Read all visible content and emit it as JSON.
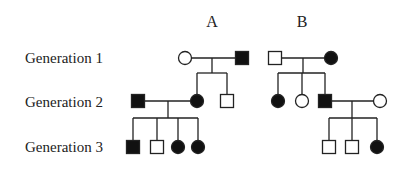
{
  "generation_labels": [
    {
      "text": "Generation 1",
      "y": 51
    },
    {
      "text": "Generation 2",
      "y": 95
    },
    {
      "text": "Generation 3",
      "y": 140
    }
  ],
  "families": [
    {
      "label": "A",
      "x": 212,
      "y": 14
    },
    {
      "label": "B",
      "x": 302,
      "y": 14
    }
  ],
  "colors": {
    "stroke": "#222222",
    "fill_affected": "#111111",
    "fill_unaffected": "#ffffff"
  },
  "symbol_size": 13,
  "individuals": [
    {
      "id": "A-I-1",
      "family": "A",
      "generation": 1,
      "sex": "female",
      "affected": false,
      "x": 185,
      "y": 58
    },
    {
      "id": "A-I-2",
      "family": "A",
      "generation": 1,
      "sex": "male",
      "affected": true,
      "x": 242,
      "y": 58
    },
    {
      "id": "A-II-1",
      "family": "A",
      "generation": 2,
      "sex": "male",
      "affected": true,
      "x": 138,
      "y": 101
    },
    {
      "id": "A-II-2",
      "family": "A",
      "generation": 2,
      "sex": "female",
      "affected": true,
      "x": 197,
      "y": 101
    },
    {
      "id": "A-II-3",
      "family": "A",
      "generation": 2,
      "sex": "male",
      "affected": false,
      "x": 227,
      "y": 101
    },
    {
      "id": "A-III-1",
      "family": "A",
      "generation": 3,
      "sex": "male",
      "affected": true,
      "x": 133,
      "y": 147
    },
    {
      "id": "A-III-2",
      "family": "A",
      "generation": 3,
      "sex": "male",
      "affected": false,
      "x": 157,
      "y": 147
    },
    {
      "id": "A-III-3",
      "family": "A",
      "generation": 3,
      "sex": "female",
      "affected": true,
      "x": 178,
      "y": 147
    },
    {
      "id": "A-III-4",
      "family": "A",
      "generation": 3,
      "sex": "female",
      "affected": true,
      "x": 198,
      "y": 147
    },
    {
      "id": "B-I-1",
      "family": "B",
      "generation": 1,
      "sex": "male",
      "affected": false,
      "x": 275,
      "y": 58
    },
    {
      "id": "B-I-2",
      "family": "B",
      "generation": 1,
      "sex": "female",
      "affected": true,
      "x": 331,
      "y": 58
    },
    {
      "id": "B-II-1",
      "family": "B",
      "generation": 2,
      "sex": "female",
      "affected": true,
      "x": 278,
      "y": 101
    },
    {
      "id": "B-II-2",
      "family": "B",
      "generation": 2,
      "sex": "female",
      "affected": false,
      "x": 302,
      "y": 101
    },
    {
      "id": "B-II-3",
      "family": "B",
      "generation": 2,
      "sex": "male",
      "affected": true,
      "x": 325,
      "y": 101
    },
    {
      "id": "B-II-4",
      "family": "B",
      "generation": 2,
      "sex": "female",
      "affected": false,
      "x": 380,
      "y": 101
    },
    {
      "id": "B-III-1",
      "family": "B",
      "generation": 3,
      "sex": "male",
      "affected": false,
      "x": 329,
      "y": 147
    },
    {
      "id": "B-III-2",
      "family": "B",
      "generation": 3,
      "sex": "male",
      "affected": false,
      "x": 352,
      "y": 147
    },
    {
      "id": "B-III-3",
      "family": "B",
      "generation": 3,
      "sex": "female",
      "affected": true,
      "x": 377,
      "y": 147
    }
  ],
  "matings": [
    {
      "id": "A-I",
      "x1": 192,
      "x2": 235,
      "y": 58,
      "drop_x": 212,
      "sib_y": 73,
      "children_x": [
        197,
        227
      ],
      "child_top": 94
    },
    {
      "id": "A-II",
      "x1": 145,
      "x2": 190,
      "y": 101,
      "drop_x": 168,
      "sib_y": 118,
      "children_x": [
        133,
        157,
        178,
        198
      ],
      "child_top": 140
    },
    {
      "id": "B-I",
      "x1": 282,
      "x2": 324,
      "y": 58,
      "drop_x": 303,
      "sib_y": 73,
      "children_x": [
        278,
        302,
        325
      ],
      "child_top": 94
    },
    {
      "id": "B-II",
      "x1": 332,
      "x2": 373,
      "y": 101,
      "drop_x": 352,
      "sib_y": 118,
      "children_x": [
        329,
        352,
        377
      ],
      "child_top": 140
    }
  ]
}
